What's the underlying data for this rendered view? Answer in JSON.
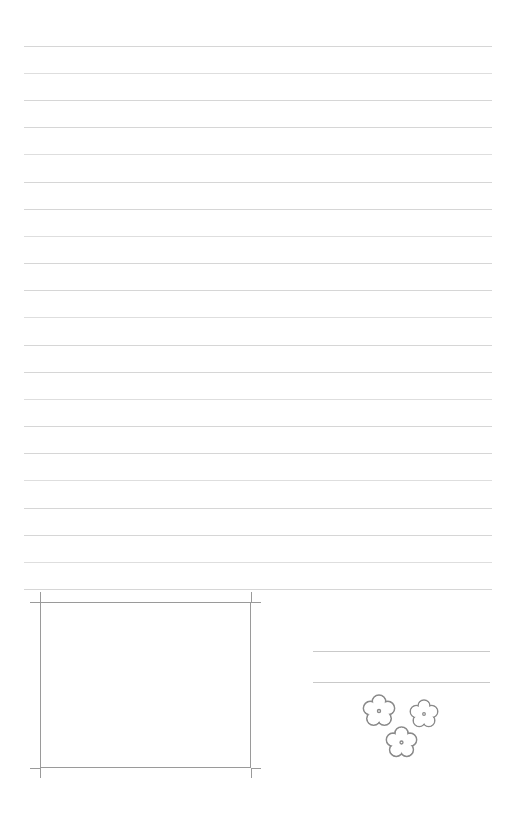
{
  "page": {
    "width": 517,
    "height": 814,
    "background_color": "#ffffff"
  },
  "ruled_lines": {
    "count": 21,
    "color": "#cfcfcf",
    "x_start": 24,
    "x_end": 492,
    "first_y": 46,
    "spacing": 27.1,
    "y_positions": [
      46,
      73,
      100,
      127,
      154,
      182,
      209,
      236,
      263,
      290,
      317,
      345,
      372,
      399,
      426,
      453,
      480,
      508,
      535,
      562,
      589
    ]
  },
  "answer_box": {
    "label": "drawing-box",
    "x": 40,
    "y": 602,
    "width": 211,
    "height": 166,
    "border_color": "#9a9a9a",
    "tick_overhang": 10
  },
  "side_lines": {
    "color": "#c9c9c9",
    "x_start": 313,
    "x_end": 490,
    "y_positions": [
      651,
      682
    ]
  },
  "flowers": {
    "icon_name": "flower-icon",
    "count": 3,
    "stroke_color": "#8a8a8a",
    "fill_color": "#ffffff",
    "items": [
      {
        "cx": 379,
        "cy": 711,
        "size": 34
      },
      {
        "cx": 424,
        "cy": 714,
        "size": 30
      },
      {
        "cx": 401,
        "cy": 742,
        "size": 33
      }
    ]
  }
}
